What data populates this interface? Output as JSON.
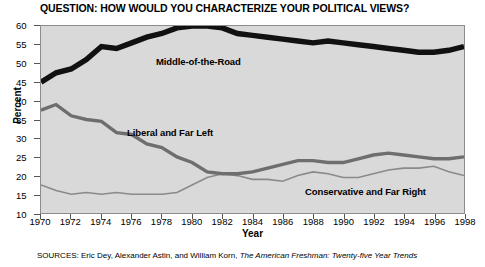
{
  "chart_data": {
    "type": "line",
    "title": "QUESTION: HOW WOULD YOU CHARACTERIZE YOUR POLITICAL VIEWS?",
    "xlabel": "Year",
    "ylabel": "Percent",
    "xlim": [
      1970,
      1998
    ],
    "ylim": [
      10,
      60
    ],
    "yticks": [
      10,
      15,
      20,
      25,
      30,
      35,
      40,
      45,
      50,
      55,
      60
    ],
    "xticks": [
      1970,
      1972,
      1974,
      1976,
      1978,
      1980,
      1982,
      1984,
      1986,
      1988,
      1990,
      1992,
      1994,
      1996,
      1998
    ],
    "grid": false,
    "legend_position": "inline-labels",
    "plot_background": "#d9d9d9",
    "x": [
      1970,
      1971,
      1972,
      1973,
      1974,
      1975,
      1976,
      1977,
      1978,
      1979,
      1980,
      1981,
      1982,
      1983,
      1984,
      1985,
      1986,
      1987,
      1988,
      1989,
      1990,
      1991,
      1992,
      1993,
      1994,
      1995,
      1996,
      1997,
      1998
    ],
    "series": [
      {
        "name": "Middle-of-the-Road",
        "color": "#111111",
        "width": 5.5,
        "values": [
          45.0,
          47.5,
          48.5,
          51.0,
          54.5,
          54.0,
          55.5,
          57.0,
          58.0,
          59.5,
          60.0,
          60.0,
          59.5,
          58.0,
          57.5,
          57.0,
          56.5,
          56.0,
          55.5,
          56.0,
          55.5,
          55.0,
          54.5,
          54.0,
          53.5,
          53.0,
          53.0,
          53.5,
          54.5
        ]
      },
      {
        "name": "Liberal and Far Left",
        "color": "#6e6e6e",
        "width": 3.4,
        "values": [
          37.5,
          39.0,
          36.0,
          35.0,
          34.5,
          31.5,
          31.0,
          28.5,
          27.5,
          25.0,
          23.5,
          21.0,
          20.5,
          20.5,
          21.0,
          22.0,
          23.0,
          24.0,
          24.0,
          23.5,
          23.5,
          24.5,
          25.5,
          26.0,
          25.5,
          25.0,
          24.5,
          24.5,
          25.0
        ]
      },
      {
        "name": "Conservative and Far Right",
        "color": "#8a8a8a",
        "width": 1.6,
        "values": [
          17.5,
          16.0,
          15.0,
          15.5,
          15.0,
          15.5,
          15.0,
          15.0,
          15.0,
          15.5,
          17.5,
          19.5,
          20.5,
          20.0,
          19.0,
          19.0,
          18.5,
          20.0,
          21.0,
          20.5,
          19.5,
          19.5,
          20.5,
          21.5,
          22.0,
          22.0,
          22.5,
          21.0,
          20.0
        ]
      }
    ],
    "annotations": [
      {
        "text": "Middle-of-the-Road"
      },
      {
        "text": "Liberal and Far Left"
      },
      {
        "text": "Conservative and Far Right"
      }
    ]
  },
  "source": {
    "label": "SOURCES:",
    "authors": "Eric Dey, Alexander Astin, and William Korn,",
    "publication": "The American Freshman: Twenty-five Year Trends"
  }
}
